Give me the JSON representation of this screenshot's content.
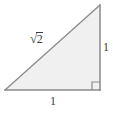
{
  "figure": {
    "kind": "right-triangle",
    "background_color": "#ffffff",
    "fill_color": "#f0f0f0",
    "stroke_color": "#808080",
    "label_color": "#3a3a3a",
    "canvas": {
      "width": 113,
      "height": 113
    },
    "vertices": {
      "bottom_left": {
        "x": 5,
        "y": 90
      },
      "bottom_right": {
        "x": 100,
        "y": 90
      },
      "top_right": {
        "x": 100,
        "y": 5
      }
    },
    "right_angle_marker": {
      "corner": "bottom_right",
      "size": 8,
      "x": 92,
      "y": 82
    },
    "labels": {
      "hypotenuse": {
        "radical_symbol": "√",
        "radicand": "2",
        "full_text": "√2",
        "position": "above-hypotenuse"
      },
      "vertical_leg": {
        "text": "1",
        "position": "right-of-vertical-leg"
      },
      "horizontal_leg": {
        "text": "1",
        "position": "below-horizontal-leg"
      }
    }
  }
}
